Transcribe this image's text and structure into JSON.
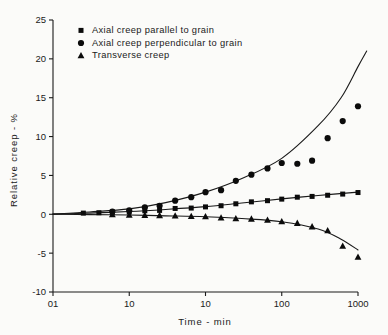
{
  "chart_data": {
    "type": "scatter",
    "title": "",
    "xlabel": "Time - min",
    "ylabel": "Relative creep - %",
    "xscale": "log",
    "xlim": [
      0.1,
      1000
    ],
    "ylim": [
      -10,
      25
    ],
    "grid": false,
    "legend_position": "top-left",
    "xticks": [
      0.1,
      1,
      10,
      100,
      1000
    ],
    "xtick_labels": [
      "01",
      "10",
      "10",
      "100",
      "1000"
    ],
    "yticks": [
      25,
      20,
      15,
      10,
      5,
      0,
      -5,
      -10
    ],
    "ytick_labels": [
      "25",
      "20",
      "15",
      "10",
      "5",
      "0",
      "-5",
      "-10"
    ],
    "series": [
      {
        "name": "Axial creep parallel to grain",
        "marker": "square",
        "color": "#0b0b0b",
        "points": [
          [
            0.25,
            0.15
          ],
          [
            0.4,
            0.2
          ],
          [
            0.6,
            0.25
          ],
          [
            1.0,
            0.3
          ],
          [
            1.6,
            0.45
          ],
          [
            2.5,
            0.5
          ],
          [
            4.0,
            0.75
          ],
          [
            6.5,
            0.8
          ],
          [
            10,
            0.95
          ],
          [
            16,
            1.1
          ],
          [
            25,
            1.35
          ],
          [
            40,
            1.6
          ],
          [
            65,
            1.75
          ],
          [
            100,
            1.95
          ],
          [
            160,
            2.2
          ],
          [
            250,
            2.3
          ],
          [
            400,
            2.45
          ],
          [
            630,
            2.6
          ],
          [
            1000,
            2.8
          ]
        ]
      },
      {
        "name": "Axial creep perpendicular to grain",
        "marker": "circle",
        "color": "#0b0b0b",
        "points": [
          [
            0.6,
            0.35
          ],
          [
            1.0,
            0.5
          ],
          [
            1.6,
            0.9
          ],
          [
            2.5,
            1.1
          ],
          [
            4.0,
            1.75
          ],
          [
            6.5,
            2.2
          ],
          [
            10,
            2.85
          ],
          [
            16,
            3.1
          ],
          [
            25,
            4.3
          ],
          [
            40,
            5.1
          ],
          [
            65,
            5.9
          ],
          [
            100,
            6.6
          ],
          [
            160,
            6.5
          ],
          [
            250,
            6.9
          ],
          [
            400,
            9.8
          ],
          [
            630,
            12.0
          ],
          [
            1000,
            13.9
          ],
          [
            1600,
            15.9
          ],
          [
            2500,
            17.9
          ],
          [
            4000,
            20.1
          ],
          [
            6300,
            21.9
          ]
        ]
      },
      {
        "name": "Transverse creep",
        "marker": "triangle",
        "color": "#0b0b0b",
        "points": [
          [
            0.6,
            -0.05
          ],
          [
            1.0,
            -0.1
          ],
          [
            1.6,
            -0.12
          ],
          [
            2.5,
            -0.15
          ],
          [
            4.0,
            -0.2
          ],
          [
            6.5,
            -0.25
          ],
          [
            10,
            -0.3
          ],
          [
            16,
            -0.45
          ],
          [
            25,
            -0.55
          ],
          [
            40,
            -0.6
          ],
          [
            65,
            -0.75
          ],
          [
            100,
            -0.95
          ],
          [
            160,
            -1.15
          ],
          [
            250,
            -1.6
          ],
          [
            400,
            -2.1
          ],
          [
            630,
            -4.1
          ],
          [
            1000,
            -5.5
          ],
          [
            1600,
            -7.0
          ]
        ]
      }
    ],
    "fit_curves": [
      {
        "name": "Axial creep parallel to grain fit",
        "points": [
          [
            0.1,
            0.02
          ],
          [
            0.3,
            0.15
          ],
          [
            1,
            0.35
          ],
          [
            3,
            0.62
          ],
          [
            10,
            0.98
          ],
          [
            30,
            1.45
          ],
          [
            100,
            1.98
          ],
          [
            300,
            2.42
          ],
          [
            1000,
            2.85
          ]
        ]
      },
      {
        "name": "Axial creep perpendicular to grain fit",
        "points": [
          [
            0.1,
            0.02
          ],
          [
            0.3,
            0.3
          ],
          [
            1,
            0.7
          ],
          [
            3,
            1.5
          ],
          [
            10,
            2.85
          ],
          [
            30,
            4.6
          ],
          [
            100,
            7.2
          ],
          [
            300,
            11.4
          ],
          [
            600,
            15.0
          ],
          [
            1000,
            19.0
          ],
          [
            1300,
            21.0
          ]
        ]
      },
      {
        "name": "Transverse creep fit",
        "points": [
          [
            0.1,
            0.02
          ],
          [
            0.3,
            -0.04
          ],
          [
            1,
            -0.1
          ],
          [
            3,
            -0.2
          ],
          [
            10,
            -0.32
          ],
          [
            30,
            -0.55
          ],
          [
            100,
            -0.95
          ],
          [
            300,
            -1.9
          ],
          [
            600,
            -3.2
          ],
          [
            1000,
            -4.6
          ]
        ]
      }
    ]
  },
  "legend": {
    "entries": [
      {
        "marker": "square",
        "label": "Axial  creep  parallel  to  grain"
      },
      {
        "marker": "circle",
        "label": "Axial  creep  perpendicular  to  grain"
      },
      {
        "marker": "triangle",
        "label": "Transverse  creep"
      }
    ]
  },
  "axes": {
    "x_title": "Time - min",
    "y_title": "Relative  creep -  %"
  }
}
